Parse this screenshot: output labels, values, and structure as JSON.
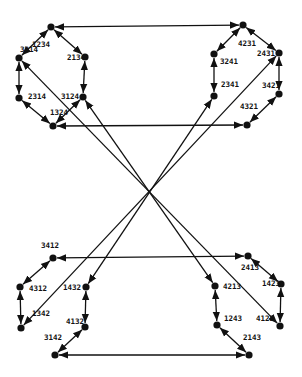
{
  "diagram": {
    "nodes": [
      {
        "id": "1234",
        "x": 51,
        "y": 27,
        "lx": 32,
        "ly": 47
      },
      {
        "id": "2134",
        "x": 85,
        "y": 57,
        "lx": 67,
        "ly": 60
      },
      {
        "id": "3214",
        "x": 19,
        "y": 58,
        "lx": 20,
        "ly": 52
      },
      {
        "id": "2314",
        "x": 19,
        "y": 98,
        "lx": 28,
        "ly": 99
      },
      {
        "id": "3124",
        "x": 83,
        "y": 97,
        "lx": 61,
        "ly": 99
      },
      {
        "id": "1324",
        "x": 53,
        "y": 126,
        "lx": 50,
        "ly": 115
      },
      {
        "id": "4231",
        "x": 243,
        "y": 25,
        "lx": 238,
        "ly": 46
      },
      {
        "id": "3241",
        "x": 214,
        "y": 54,
        "lx": 220,
        "ly": 64
      },
      {
        "id": "2431",
        "x": 279,
        "y": 53,
        "lx": 257,
        "ly": 56
      },
      {
        "id": "2341",
        "x": 214,
        "y": 96,
        "lx": 221,
        "ly": 87
      },
      {
        "id": "3421",
        "x": 279,
        "y": 94,
        "lx": 262,
        "ly": 88
      },
      {
        "id": "4321",
        "x": 247,
        "y": 125,
        "lx": 240,
        "ly": 109
      },
      {
        "id": "3412",
        "x": 53,
        "y": 258,
        "lx": 41,
        "ly": 248
      },
      {
        "id": "4312",
        "x": 20,
        "y": 287,
        "lx": 29,
        "ly": 291
      },
      {
        "id": "1432",
        "x": 86,
        "y": 287,
        "lx": 63,
        "ly": 290
      },
      {
        "id": "1342",
        "x": 21,
        "y": 328,
        "lx": 32,
        "ly": 316
      },
      {
        "id": "4132",
        "x": 85,
        "y": 327,
        "lx": 66,
        "ly": 324
      },
      {
        "id": "3142",
        "x": 55,
        "y": 355,
        "lx": 44,
        "ly": 340
      },
      {
        "id": "2413",
        "x": 248,
        "y": 256,
        "lx": 241,
        "ly": 270
      },
      {
        "id": "4213",
        "x": 215,
        "y": 286,
        "lx": 223,
        "ly": 289
      },
      {
        "id": "1423",
        "x": 281,
        "y": 284,
        "lx": 262,
        "ly": 286
      },
      {
        "id": "1243",
        "x": 217,
        "y": 325,
        "lx": 224,
        "ly": 321
      },
      {
        "id": "4123",
        "x": 280,
        "y": 326,
        "lx": 256,
        "ly": 321
      },
      {
        "id": "2143",
        "x": 249,
        "y": 355,
        "lx": 243,
        "ly": 340
      }
    ],
    "edges": [
      [
        "1234",
        "2134"
      ],
      [
        "2134",
        "3124"
      ],
      [
        "3124",
        "1324"
      ],
      [
        "1324",
        "2314"
      ],
      [
        "2314",
        "3214"
      ],
      [
        "3214",
        "1234"
      ],
      [
        "4231",
        "3241"
      ],
      [
        "3241",
        "2341"
      ],
      [
        "4231",
        "2431"
      ],
      [
        "2431",
        "3421"
      ],
      [
        "3421",
        "4321"
      ],
      [
        "3412",
        "4312"
      ],
      [
        "4312",
        "1342"
      ],
      [
        "1432",
        "4132"
      ],
      [
        "4132",
        "3142"
      ],
      [
        "2413",
        "1423"
      ],
      [
        "1423",
        "4123"
      ],
      [
        "4213",
        "1243"
      ],
      [
        "1243",
        "2143"
      ]
    ],
    "long_edges": [
      [
        "4231",
        "1234"
      ],
      [
        "4321",
        "1324"
      ],
      [
        "2413",
        "3412"
      ],
      [
        "2143",
        "3142"
      ],
      [
        "3214",
        "4123"
      ],
      [
        "3124",
        "4213"
      ],
      [
        "2341",
        "1432"
      ],
      [
        "2431",
        "1342"
      ]
    ]
  }
}
